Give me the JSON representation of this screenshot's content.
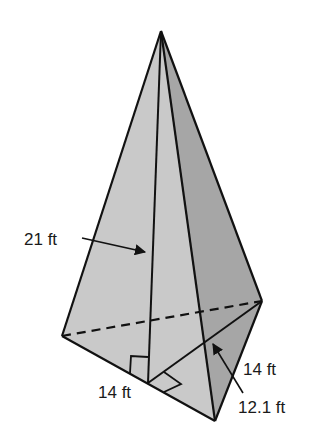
{
  "figure": {
    "type": "triangular-pyramid",
    "labels": {
      "height": "21 ft",
      "base_side_front": "14 ft",
      "base_side_right": "14 ft",
      "base_altitude": "12.1 ft"
    },
    "colors": {
      "left_face": "#c9c9c9",
      "right_face": "#a8a8a8",
      "edge": "#111111",
      "background": "#ffffff"
    }
  }
}
